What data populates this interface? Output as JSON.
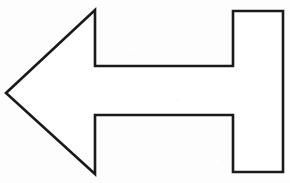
{
  "image": {
    "kind": "line-drawing",
    "subject": "left-pointing-arrow",
    "description": "Outline drawing of a block arrow pointing left",
    "width": 290,
    "height": 183,
    "background_color": "#fdfdfd",
    "stroke_color": "#1a1a1a",
    "fill_color": "#ffffff",
    "stroke_width": 2.6
  },
  "shape": {
    "name": "arrow-outline",
    "closed": true,
    "points": [
      [
        6,
        93
      ],
      [
        95,
        10
      ],
      [
        95,
        66
      ],
      [
        233,
        66
      ],
      [
        233,
        11
      ],
      [
        283,
        11
      ],
      [
        283,
        172
      ],
      [
        233,
        172
      ],
      [
        233,
        115
      ],
      [
        95,
        115
      ],
      [
        95,
        174
      ]
    ],
    "path": "M 6 93 L 95 10 L 95 66 L 233 66 L 233 11 L 283 11 L 283 172 L 233 172 L 233 115 L 95 115 L 95 174 Z"
  }
}
